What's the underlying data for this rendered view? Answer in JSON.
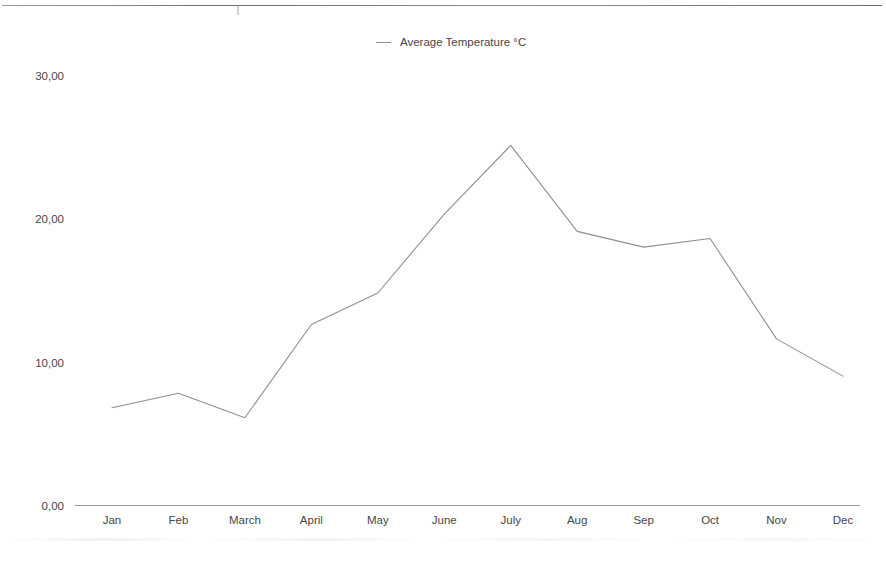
{
  "chart_data": {
    "type": "line",
    "title": "",
    "subtitle": "",
    "xlabel": "",
    "ylabel": "",
    "categories": [
      "Jan",
      "Feb",
      "March",
      "April",
      "May",
      "June",
      "July",
      "Aug",
      "Sep",
      "Oct",
      "Nov",
      "Dec"
    ],
    "series": [
      {
        "name": "Average Temperature °C",
        "values": [
          7.0,
          8.0,
          6.3,
          12.8,
          15.0,
          20.5,
          25.3,
          19.3,
          18.2,
          18.8,
          11.8,
          9.2
        ]
      }
    ],
    "ylim": [
      0,
      30
    ],
    "y_ticks": [
      0,
      10,
      20,
      30
    ],
    "y_tick_labels": [
      "0,00",
      "10,00",
      "20,00",
      "30,00"
    ],
    "decimal_separator": ",",
    "grid": false,
    "legend_position": "top",
    "line_color": "#8e8f93",
    "markers": false
  },
  "legend": {
    "entries": [
      {
        "label": "Average Temperature °C",
        "color": "#8e8f93",
        "marker": "line-dash-icon"
      }
    ]
  },
  "axes": {
    "y_tick_labels": [
      "30,00",
      "20,00",
      "10,00",
      "0,00"
    ],
    "x_tick_labels": [
      "Jan",
      "Feb",
      "March",
      "April",
      "May",
      "June",
      "July",
      "Aug",
      "Sep",
      "Oct",
      "Nov",
      "Dec"
    ]
  }
}
